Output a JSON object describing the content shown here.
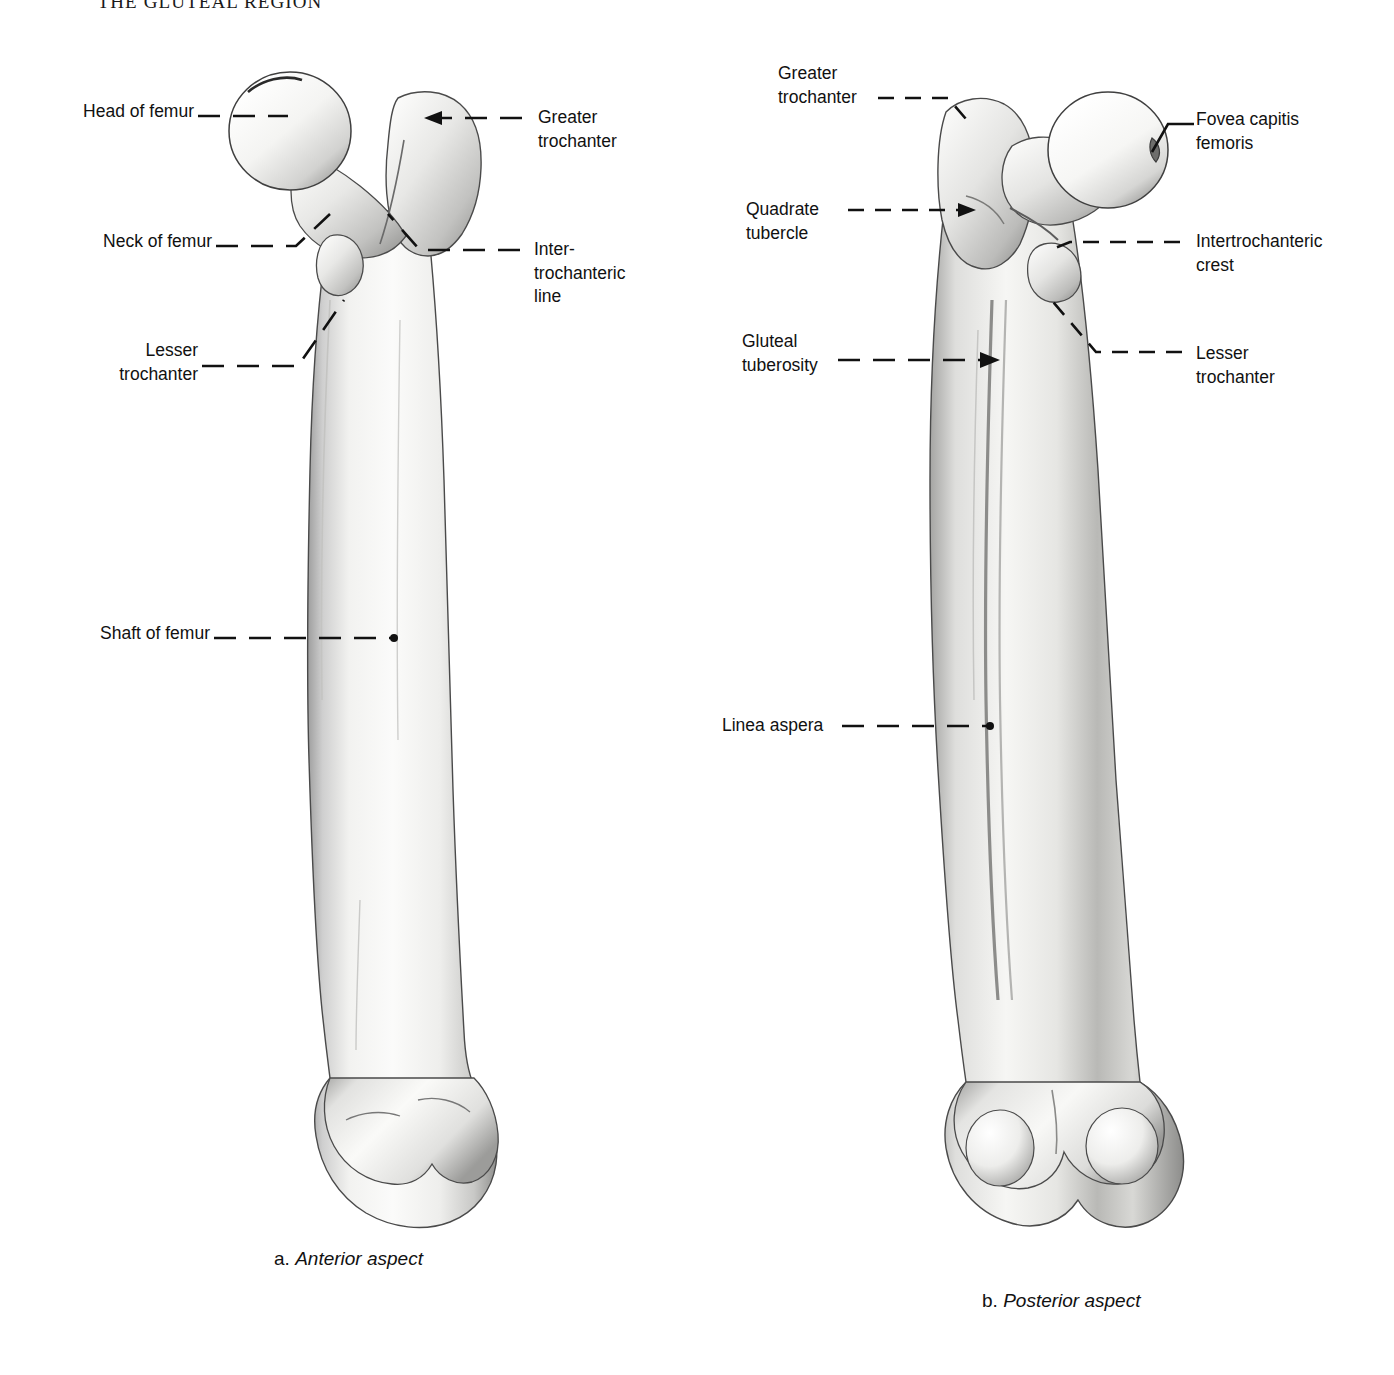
{
  "page": {
    "running_head": "THE GLUTEAL REGION",
    "background_color": "#ffffff",
    "ink_color": "#111111"
  },
  "figures": [
    {
      "id": "figure-a",
      "caption_letter": "a.",
      "caption_text": "Anterior aspect",
      "view": "anterior",
      "labels": [
        {
          "name": "head-of-femur",
          "text": "Head of femur",
          "align": "right"
        },
        {
          "name": "neck-of-femur",
          "text": "Neck of femur",
          "align": "right"
        },
        {
          "name": "lesser-trochanter-a",
          "text": "Lesser\ntrochanter",
          "align": "right"
        },
        {
          "name": "shaft-of-femur",
          "text": "Shaft of femur",
          "align": "right"
        },
        {
          "name": "greater-trochanter-a",
          "text": "Greater\ntrochanter",
          "align": "left"
        },
        {
          "name": "intertrochanteric-line",
          "text": "Inter-\ntrochanteric\nline",
          "align": "left"
        }
      ]
    },
    {
      "id": "figure-b",
      "caption_letter": "b.",
      "caption_text": "Posterior aspect",
      "view": "posterior",
      "labels": [
        {
          "name": "greater-trochanter-b",
          "text": "Greater\ntrochanter",
          "align": "left"
        },
        {
          "name": "quadrate-tubercle",
          "text": "Quadrate\ntubercle",
          "align": "left"
        },
        {
          "name": "gluteal-tuberosity",
          "text": "Gluteal\ntuberosity",
          "align": "left"
        },
        {
          "name": "linea-aspera",
          "text": "Linea aspera",
          "align": "left"
        },
        {
          "name": "fovea-capitis-femoris",
          "text": "Fovea capitis\nfemoris",
          "align": "left"
        },
        {
          "name": "intertrochanteric-crest",
          "text": "Intertrochanteric\ncrest",
          "align": "left"
        },
        {
          "name": "lesser-trochanter-b",
          "text": "Lesser\ntrochanter",
          "align": "left"
        }
      ]
    }
  ]
}
